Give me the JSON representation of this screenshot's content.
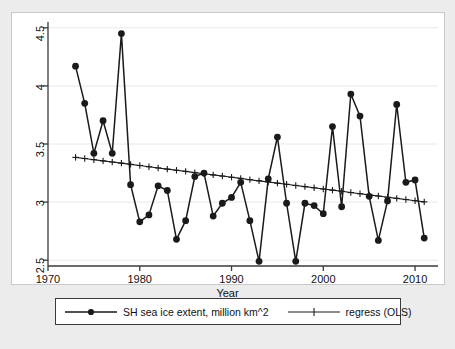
{
  "chart_data": {
    "type": "line",
    "title": "",
    "xlabel": "Year",
    "ylabel": "",
    "xlim": [
      1970,
      2012.5
    ],
    "ylim": [
      2.45,
      4.55
    ],
    "xticks": [
      1970,
      1980,
      1990,
      2000,
      2010
    ],
    "xticklabels": [
      "1970",
      "1980",
      "1990",
      "2000",
      "2010"
    ],
    "yticks": [
      2.5,
      3,
      3.5,
      4,
      4.5
    ],
    "yticklabels": [
      "2.5",
      "3",
      "3.5",
      "4",
      "4.5"
    ],
    "grid": "horizontal",
    "legend_position": "below-axes",
    "x": [
      1973,
      1974,
      1975,
      1976,
      1977,
      1978,
      1979,
      1980,
      1981,
      1982,
      1983,
      1984,
      1985,
      1986,
      1987,
      1988,
      1989,
      1990,
      1991,
      1992,
      1993,
      1994,
      1995,
      1996,
      1997,
      1998,
      1999,
      2000,
      2001,
      2002,
      2003,
      2004,
      2005,
      2006,
      2007,
      2008,
      2009,
      2010,
      2011
    ],
    "series": [
      {
        "name": "SH sea ice extent, million km^2",
        "marker": "filled-circle",
        "values": [
          4.17,
          3.85,
          3.42,
          3.7,
          3.42,
          4.45,
          3.15,
          2.83,
          2.89,
          3.14,
          3.1,
          2.68,
          2.84,
          3.22,
          3.25,
          2.88,
          2.99,
          3.04,
          3.17,
          2.84,
          2.49,
          3.2,
          3.56,
          2.99,
          2.49,
          2.99,
          2.97,
          2.9,
          3.65,
          2.96,
          3.93,
          3.74,
          3.05,
          2.67,
          3.01,
          3.84,
          3.17,
          3.19,
          2.69
        ]
      },
      {
        "name": "regress (OLS)",
        "marker": "plus",
        "values": [
          3.385,
          3.375,
          3.365,
          3.355,
          3.345,
          3.335,
          3.325,
          3.315,
          3.304,
          3.294,
          3.284,
          3.274,
          3.264,
          3.254,
          3.244,
          3.234,
          3.224,
          3.214,
          3.204,
          3.193,
          3.183,
          3.173,
          3.163,
          3.153,
          3.143,
          3.133,
          3.123,
          3.113,
          3.103,
          3.093,
          3.082,
          3.072,
          3.062,
          3.052,
          3.042,
          3.032,
          3.022,
          3.012,
          3.002
        ]
      }
    ]
  },
  "axis": {
    "x_title": "Year"
  },
  "legend": {
    "entries": [
      {
        "label": "SH sea ice extent, million km^2"
      },
      {
        "label": "regress (OLS)"
      }
    ]
  },
  "colors": {
    "line": "#1a1a1a",
    "grid": "#e8e8e8",
    "frame": "#3a3a3a",
    "page_background": "#ececec",
    "plot_background": "#ffffff"
  }
}
